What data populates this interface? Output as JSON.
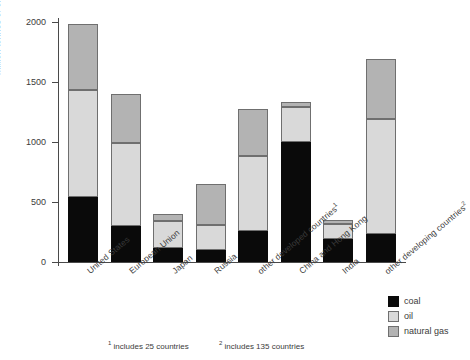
{
  "chart_data": {
    "type": "bar",
    "subtype": "stacked-vertical",
    "title": "",
    "xlabel": "",
    "ylabel": "million tonnes of oil equivalent",
    "ylim": [
      0,
      2000
    ],
    "yticks": [
      0,
      500,
      1000,
      1500,
      2000
    ],
    "ytick_labels": [
      "0",
      "500",
      "1000",
      "1500",
      "2000"
    ],
    "grid": false,
    "legend_position": "bottom-right",
    "categories": [
      "United States",
      "European Union",
      "Japan",
      "Russia",
      "other developed countries",
      "China and Hong Kong",
      "India",
      "other developing countries"
    ],
    "category_footnote_markers": [
      "",
      "",
      "",
      "",
      "1",
      "",
      "",
      "2"
    ],
    "series": [
      {
        "name": "coal",
        "color": "#0a0a0a",
        "values": [
          545,
          300,
          120,
          100,
          255,
          1000,
          190,
          230
        ]
      },
      {
        "name": "oil",
        "color": "#d9d9d9",
        "values": [
          890,
          690,
          220,
          205,
          630,
          290,
          130,
          960
        ]
      },
      {
        "name": "natural gas",
        "color": "#b3b3b3",
        "values": [
          545,
          410,
          60,
          345,
          390,
          40,
          30,
          500
        ]
      }
    ],
    "totals": [
      1980,
      1400,
      400,
      650,
      1275,
      1330,
      350,
      1690
    ],
    "annotations": []
  },
  "legend": {
    "items": [
      {
        "label": "coal",
        "color": "#0a0a0a"
      },
      {
        "label": "oil",
        "color": "#d9d9d9"
      },
      {
        "label": "natural gas",
        "color": "#b3b3b3"
      }
    ]
  },
  "footnotes": [
    {
      "marker": "1",
      "text": "includes 25 countries"
    },
    {
      "marker": "2",
      "text": "includes 135 countries"
    }
  ]
}
